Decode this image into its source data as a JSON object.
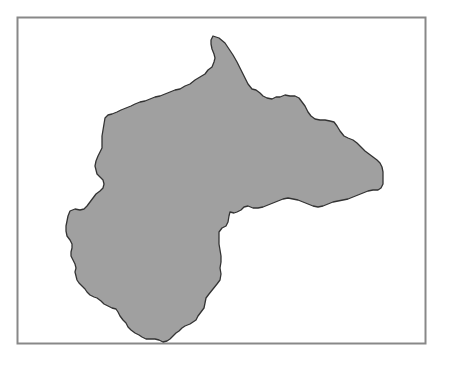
{
  "map": {
    "title": "",
    "frame": {
      "x": 17,
      "y": 17,
      "width": 205,
      "height": 163,
      "stroke": "#808080"
    },
    "region": {
      "name": "region-outline",
      "fill": "#a0a0a0",
      "stroke": "#303030",
      "stroke_width": 1.3
    }
  },
  "colors": {
    "background": "#ffffff",
    "land": "#a0a0a0",
    "outline": "#303030",
    "frame": "#808080"
  }
}
